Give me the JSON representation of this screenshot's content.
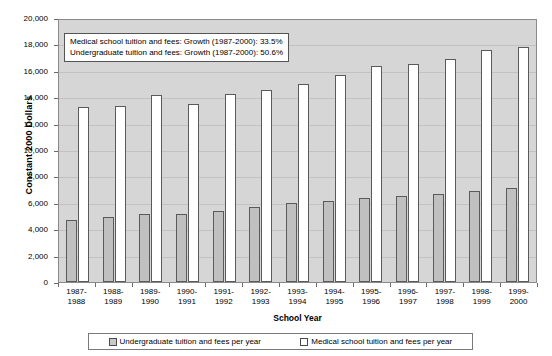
{
  "chart_data": {
    "type": "bar",
    "title": "",
    "xlabel": "School Year",
    "ylabel": "Constant 2000 Dollars",
    "ylim": [
      0,
      20000
    ],
    "ytick_labels": [
      "20,000",
      "18,000",
      "16,000",
      "14,000",
      "12,000",
      "10,000",
      "8,000",
      "6,000",
      "4,000",
      "2,000",
      "0"
    ],
    "ytick_values": [
      20000,
      18000,
      16000,
      14000,
      12000,
      10000,
      8000,
      6000,
      4000,
      2000,
      0
    ],
    "grid": true,
    "legend_position": "bottom",
    "categories": [
      "1987-\n1988",
      "1988-\n1989",
      "1989-\n1990",
      "1990-\n1991",
      "1991-\n1992",
      "1992-\n1993",
      "1993-\n1994",
      "1994-\n1995",
      "1995-\n1996",
      "1996-\n1997",
      "1997-\n1998",
      "1998-\n1999",
      "1999-\n2000"
    ],
    "category_lines": [
      [
        "1987-",
        "1988"
      ],
      [
        "1988-",
        "1989"
      ],
      [
        "1989-",
        "1990"
      ],
      [
        "1990-",
        "1991"
      ],
      [
        "1991-",
        "1992"
      ],
      [
        "1992-",
        "1993"
      ],
      [
        "1993-",
        "1994"
      ],
      [
        "1994-",
        "1995"
      ],
      [
        "1995-",
        "1996"
      ],
      [
        "1996-",
        "1997"
      ],
      [
        "1997-",
        "1998"
      ],
      [
        "1998-",
        "1999"
      ],
      [
        "1999-",
        "2000"
      ]
    ],
    "series": [
      {
        "name": "Undergraduate tuition and fees per year",
        "color": "#c0c0c0",
        "values": [
          4700,
          4950,
          5150,
          5150,
          5400,
          5650,
          5950,
          6150,
          6350,
          6500,
          6650,
          6900,
          7100
        ]
      },
      {
        "name": "Medical school tuition and fees per year",
        "color": "#ffffff",
        "values": [
          13250,
          13300,
          14200,
          13500,
          14250,
          14550,
          15000,
          15700,
          16350,
          16500,
          16900,
          17600,
          17800
        ]
      }
    ],
    "annotations": [
      "Medical school tuition and fees: Growth (1987-2000): 33.5%",
      "Undergraduate tuition and fees: Growth (1987-2000): 50.6%"
    ]
  },
  "legend": {
    "items": [
      {
        "label": "Undergraduate tuition and fees per year"
      },
      {
        "label": "Medical school tuition and fees per year"
      }
    ]
  }
}
